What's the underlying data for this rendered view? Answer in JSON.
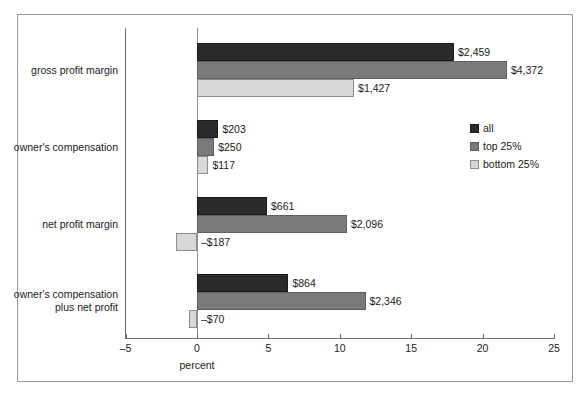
{
  "chart_data": {
    "type": "bar",
    "orientation": "horizontal",
    "title": "",
    "xlabel": "percent",
    "ylabel": "",
    "xlim": [
      -5,
      25
    ],
    "xticks": [
      -5,
      0,
      5,
      10,
      15,
      20,
      25
    ],
    "xticklabels": [
      "–5",
      "0",
      "5",
      "10",
      "15",
      "20",
      "25"
    ],
    "grid": false,
    "legend_position": "right-upper",
    "categories": [
      "gross profit margin",
      "owner's compensation",
      "net profit margin",
      "owner's compensation\nplus net profit"
    ],
    "series": [
      {
        "name": "all",
        "color": "#2b2b2b",
        "values": [
          18.0,
          1.5,
          4.9,
          6.4
        ],
        "data_labels": [
          "$2,459",
          "$203",
          "$661",
          "$864"
        ]
      },
      {
        "name": "top 25%",
        "color": "#7a7a7a",
        "values": [
          21.7,
          1.2,
          10.5,
          11.8
        ],
        "data_labels": [
          "$4,372",
          "$250",
          "$2,096",
          "$2,346"
        ]
      },
      {
        "name": "bottom 25%",
        "color": "#d8d8d8",
        "values": [
          11.0,
          0.8,
          -1.5,
          -0.55
        ],
        "data_labels": [
          "$1,427",
          "$117",
          "–$187",
          "–$70"
        ]
      }
    ]
  },
  "axis": {
    "x_title": "percent",
    "tick_labels": [
      "–5",
      "0",
      "5",
      "10",
      "15",
      "20",
      "25"
    ]
  },
  "legend": {
    "entries": [
      {
        "label": "all",
        "color": "#2b2b2b"
      },
      {
        "label": "top 25%",
        "color": "#7a7a7a"
      },
      {
        "label": "bottom 25%",
        "color": "#d8d8d8"
      }
    ]
  },
  "categories": [
    {
      "label": "gross profit margin"
    },
    {
      "label": "owner's compensation"
    },
    {
      "label": "net profit margin"
    },
    {
      "label": "owner's compensation\nplus net profit"
    }
  ],
  "bars": [
    {
      "group": 0,
      "series": "all",
      "value": 18.0,
      "label": "$2,459"
    },
    {
      "group": 0,
      "series": "top 25%",
      "value": 21.7,
      "label": "$4,372"
    },
    {
      "group": 0,
      "series": "bottom 25%",
      "value": 11.0,
      "label": "$1,427"
    },
    {
      "group": 1,
      "series": "all",
      "value": 1.5,
      "label": "$203"
    },
    {
      "group": 1,
      "series": "top 25%",
      "value": 1.2,
      "label": "$250"
    },
    {
      "group": 1,
      "series": "bottom 25%",
      "value": 0.8,
      "label": "$117"
    },
    {
      "group": 2,
      "series": "all",
      "value": 4.9,
      "label": "$661"
    },
    {
      "group": 2,
      "series": "top 25%",
      "value": 10.5,
      "label": "$2,096"
    },
    {
      "group": 2,
      "series": "bottom 25%",
      "value": -1.5,
      "label": "–$187"
    },
    {
      "group": 3,
      "series": "all",
      "value": 6.4,
      "label": "$864"
    },
    {
      "group": 3,
      "series": "top 25%",
      "value": 11.8,
      "label": "$2,346"
    },
    {
      "group": 3,
      "series": "bottom 25%",
      "value": -0.55,
      "label": "–$70"
    }
  ]
}
